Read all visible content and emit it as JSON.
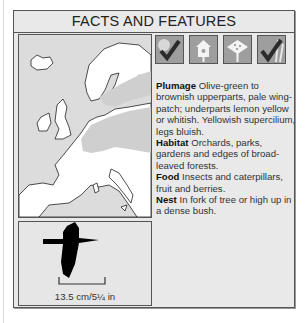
{
  "panel": {
    "title": "FACTS AND FEATURES"
  },
  "icons": [
    {
      "name": "woodland-habitat-icon",
      "checked": true
    },
    {
      "name": "nestbox-icon",
      "checked": false
    },
    {
      "name": "bird-table-icon",
      "checked": false
    },
    {
      "name": "reeds-habitat-icon",
      "checked": true
    }
  ],
  "facts": {
    "plumage": {
      "label": "Plumage",
      "text": " Olive-green to brownish upperparts, pale wing-patch; underparts lemon yellow or whitish. Yellowish supercilium, legs bluish."
    },
    "habitat": {
      "label": "Habitat",
      "text": " Orchards, parks, gardens and edges of broad-leaved forests."
    },
    "food": {
      "label": "Food",
      "text": " Insects and caterpillars, fruit and berries."
    },
    "nest": {
      "label": "Nest",
      "text": " In fork of tree or high up in a dense bush."
    }
  },
  "size": {
    "caption": "13.5 cm/5¼ in"
  },
  "colors": {
    "panel_bg": "#e9e9e9",
    "range_shade": "#cfcfcf",
    "land": "#ffffff",
    "icon_bg": "#9e9e9e",
    "check": "#2b2b2b"
  }
}
